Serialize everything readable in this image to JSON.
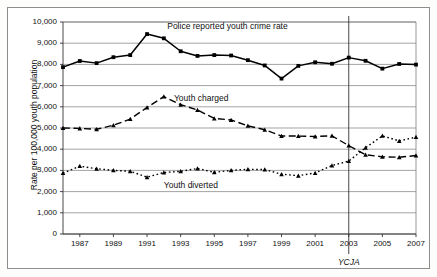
{
  "chart_data": {
    "type": "line",
    "title": "",
    "xlabel": "",
    "ylabel": "Rate per 100,000 youth population",
    "xlim": [
      1986,
      2007
    ],
    "ylim": [
      0,
      10000
    ],
    "ytick_step": 1000,
    "grid": true,
    "legend": "inline-annotations",
    "x": [
      1986,
      1987,
      1988,
      1989,
      1990,
      1991,
      1992,
      1993,
      1994,
      1995,
      1996,
      1997,
      1998,
      1999,
      2000,
      2001,
      2002,
      2003,
      2004,
      2005,
      2006,
      2007
    ],
    "ytick_labels": [
      "0",
      "1,000",
      "2,000",
      "3,000",
      "4,000",
      "5,000",
      "6,000",
      "7,000",
      "8,000",
      "9,000",
      "10,000"
    ],
    "xtick_labels": [
      "1987",
      "1989",
      "1991",
      "1993",
      "1995",
      "1997",
      "1999",
      "2001",
      "2003",
      "2005",
      "2007"
    ],
    "xticks": [
      1987,
      1989,
      1991,
      1993,
      1995,
      1997,
      1999,
      2001,
      2003,
      2005,
      2007
    ],
    "series": [
      {
        "name": "Police reported youth crime rate",
        "label": "Police reported youth crime rate",
        "style": "solid",
        "marker": "square",
        "color": "#000000",
        "values": [
          7870,
          8160,
          8060,
          8340,
          8440,
          9430,
          9230,
          8620,
          8400,
          8440,
          8420,
          8200,
          7950,
          7330,
          7930,
          8100,
          8030,
          8320,
          8170,
          7800,
          8020,
          7990
        ]
      },
      {
        "name": "Youth charged",
        "label": "Youth charged",
        "style": "dashed",
        "marker": "triangle",
        "color": "#000000",
        "values": [
          5000,
          4980,
          4940,
          5130,
          5420,
          5970,
          6480,
          6100,
          5850,
          5450,
          5380,
          5100,
          4920,
          4620,
          4620,
          4600,
          4630,
          4170,
          3740,
          3640,
          3620,
          3700
        ]
      },
      {
        "name": "Youth diverted",
        "label": "Youth diverted",
        "style": "dotted",
        "marker": "triangle",
        "color": "#000000",
        "values": [
          2870,
          3200,
          3080,
          3000,
          2960,
          2680,
          2900,
          2960,
          3090,
          2910,
          3000,
          3050,
          3040,
          2820,
          2750,
          2880,
          3230,
          3440,
          4070,
          4630,
          4390,
          4570
        ]
      }
    ],
    "annotations": [
      {
        "name": "ycja-marker",
        "label": "YCJA",
        "x": 2003,
        "type": "vertical-line"
      }
    ]
  },
  "labels": {
    "y_axis_title": "Rate per 100,000 youth population",
    "police_series_label": "Police reported youth crime rate",
    "charged_series_label": "Youth charged",
    "diverted_series_label": "Youth diverted",
    "ycja_label": "YCJA"
  }
}
